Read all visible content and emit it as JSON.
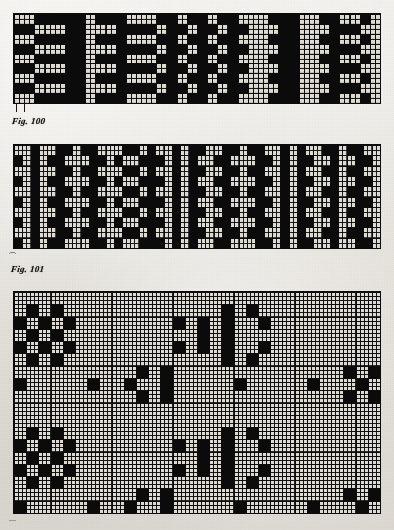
{
  "page": {
    "kind": "scanned-book-plate",
    "background_color": "#e9e7e2",
    "ink_color": "#0b0b0b",
    "grid_fill_color": "#dedcd4",
    "width": 394,
    "height": 530
  },
  "figures": [
    {
      "id": "fig-100",
      "caption": "Fig. 100",
      "type": "weave-draft-diagram",
      "frame": {
        "x": 14,
        "y": 14,
        "w": 366,
        "h": 89
      },
      "grid": {
        "cols": 36,
        "rows": 9,
        "cell_w": 10.1667,
        "cell_h": 9.8889
      },
      "subdivision": {
        "units_per_cell": 2,
        "line_width": 1
      },
      "note": "black ground with light squared blocks forming a diamond/checker repeat",
      "pattern": [
        "LLDDDDDLDDDLLLDDLDDLDDLLLDDDLLDDLLDL",
        "DDLLLDDLLLDDDDLDDLDDLDDLLLDDLLLDDDLL",
        "LLDDDDDLDDDLLLDDLDDLDDLLLDDDLLDDLLDL",
        "DDLLLDDLLLDDDDLDDLDDLDDLLLDDLLLDDDLL",
        "LLDDDDDLDDDLLLDDLDDLDDLLLDDDLLDDLLDL",
        "DDLLLDDLLLDDDDLDDLDDLDDLLLDDLLLDDDLL",
        "LLDDDDDLDDDLLLDDLDDLDDLLLDDDLLDDLLDL",
        "DDLLLDDLLLDDDDLDDLDDLDDLLLDDLLLDDDLL",
        "LLDDDDDLDDDLLLDDLDDLDDLLLDDDLLDDLLDL"
      ],
      "ticks_below": [
        {
          "x": 16,
          "y": 103,
          "w": 1,
          "h": 9
        },
        {
          "x": 24,
          "y": 103,
          "w": 1,
          "h": 9
        }
      ],
      "caption_pos": {
        "x": 12,
        "y": 116
      }
    },
    {
      "id": "fig-101",
      "caption": "Fig. 101",
      "type": "weave-draft-diagram",
      "frame": {
        "x": 14,
        "y": 145,
        "w": 366,
        "h": 103
      },
      "grid": {
        "cols": 44,
        "rows": 10,
        "cell_w": 8.3182,
        "cell_h": 10.3
      },
      "subdivision": {
        "units_per_cell": 2,
        "line_width": 1
      },
      "note": "denser black ground, alternating wide blocks and narrow single-column strips",
      "pattern": [
        "LLDLLDDLDDLLLDDLDLLDLDDLLDDLDDLLDLDLLDDLDDLL",
        "DLDLDDLLLDDLDLLDDDLDLDLLDDLLLDDLDLDDLLDLLDDL",
        "LLDLLDDLDDLLLDDLDLLDLDDLLDDLDDLLDLDLLDDLDDLL",
        "DLDLDDLLLDDLDLLDDDLDLDLLDDLLLDDLDLDDLLDLLDDL",
        "LLDLLDDLDDLLLDDLDLLDLDDLLDDLDDLLDLDLLDDLDDLL",
        "DLDLDDLLLDDLDLLDDDLDLDLLDDLLLDDLDLDDLLDLLDDL",
        "LLDLLDDLDDLLLDDLDLLDLDDLLDDLDDLLDLDLLDDLDDLL",
        "DLDLDDLLLDDLDLLDDDLDLDLLDDLLLDDLDLDDLLDLLDDL",
        "LLDLLDDLDDLLLDDLDLLDLDDLLDDLDDLLDLDLLDDLDDLL",
        "DLDLDDLLLDDLDLLDDDLDLDLLDDLLLDDLDLDDLLDLLDDL"
      ],
      "flick_mark": {
        "x": 9,
        "y": 253,
        "glyph": "⌒"
      },
      "caption_pos": {
        "x": 11,
        "y": 264
      }
    },
    {
      "id": "fig-102",
      "caption": "",
      "type": "weave-draft-diagram",
      "frame": {
        "x": 14,
        "y": 292,
        "w": 366,
        "h": 221
      },
      "grid": {
        "cols": 30,
        "rows": 18,
        "cell_w": 12.2,
        "cell_h": 12.2778
      },
      "subdivision": {
        "units_per_cell": 3,
        "line_width": 1
      },
      "note": "predominantly light squared ground with scattered solid black blocks",
      "pattern": [
        "LLLLLLLLLLLLLLLLLLLLLLLLLLLLLL",
        "LDLDLLLLLLLLLLLLLDLDLLLLLLLLLL",
        "DLDLDLLLLLLLLDLDLDLLDLLLLLLLLL",
        "LDLDLLLLLLLLLLLDLDLLLLLLLLLLLL",
        "DLDLDLLLLLLLLDLDLDLLDLLLLLLLLL",
        "LDLDLLLLLLLLLLLLLDLDLLLLLLLLLL",
        "LLLLLLLLLLDLDLLLLLLLLLLLLLLDLD",
        "DLLLLLDLLDLLDLLLLLDLLLLLDLLLDL",
        "LLLLLLLLLLDLDLLLLLLLLLLLLLLDLD",
        "LLLLLLLLLLLLLLLLLLLLLLLLLLLLLL"
      ],
      "bottom_flick": {
        "x": 9,
        "y": 517,
        "glyph": "—"
      }
    }
  ]
}
